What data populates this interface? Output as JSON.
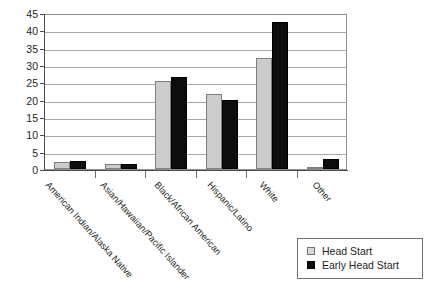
{
  "chart_data": {
    "type": "bar",
    "title": "",
    "subtitle": "",
    "xlabel": "",
    "ylabel": "",
    "ylim": [
      0,
      45
    ],
    "ytick_step": 5,
    "ytick_labels": [
      "0",
      "5",
      "10",
      "15",
      "20",
      "25",
      "30",
      "35",
      "40",
      "45"
    ],
    "grid": true,
    "legend_position": "bottom-right",
    "categories": [
      "American Indian/Alaska Native",
      "Asian/Hawaiian/Pacific Islander",
      "Black/African American",
      "Hispanic/Latino",
      "White",
      "Other"
    ],
    "series": [
      {
        "name": "Head Start",
        "color": "#cccccc",
        "values": [
          2.0,
          1.5,
          25.5,
          21.5,
          32.0,
          0.4
        ]
      },
      {
        "name": "Early Head Start",
        "color": "#0d0d0d",
        "values": [
          2.2,
          1.5,
          26.5,
          20.0,
          42.5,
          3.0
        ]
      }
    ]
  },
  "legend": {
    "items": [
      {
        "label": "Head Start",
        "swatch": "light-gray-square"
      },
      {
        "label": "Early Head Start",
        "swatch": "black-square"
      }
    ]
  },
  "colors": {
    "head_start": "#cccccc",
    "early_head_start": "#0d0d0d",
    "gridline": "#a6a9ac",
    "axis": "#4a4d50",
    "plot_border": "#8e9194",
    "text": "#231f20",
    "background": "#ffffff"
  }
}
